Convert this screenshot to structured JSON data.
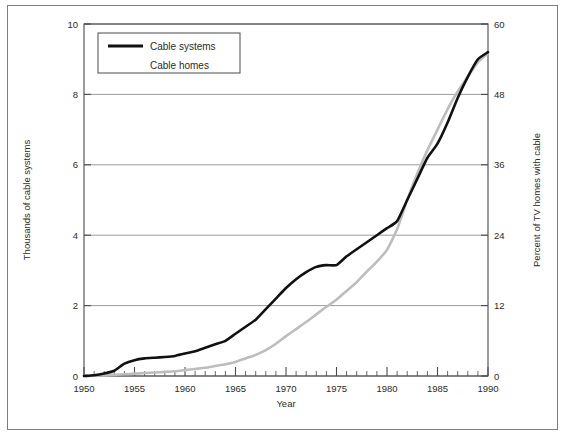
{
  "chart_data": {
    "type": "line",
    "title": "",
    "xlabel": "Year",
    "ylabel": "Thousands of cable systems",
    "ylabel_right": "Percent of TV homes with cable",
    "xlim": [
      1950,
      1990
    ],
    "ylim": [
      0,
      10
    ],
    "ylim_right": [
      0,
      60
    ],
    "grid": true,
    "grid_axis": "y",
    "legend_position": "top-left-inside",
    "x_ticks_major": [
      1950,
      1955,
      1960,
      1965,
      1970,
      1975,
      1980,
      1985,
      1990
    ],
    "x_tick_labels": [
      "1950",
      "1955",
      "1960",
      "1965",
      "1970",
      "1975",
      "1980",
      "1985",
      "1990"
    ],
    "x_minor_tick_interval": 1,
    "y_ticks_left": [
      0,
      2,
      4,
      6,
      8,
      10
    ],
    "y_tick_labels_left": [
      "0",
      "2",
      "4",
      "6",
      "8",
      "10"
    ],
    "y_ticks_right": [
      0,
      12,
      24,
      36,
      48,
      60
    ],
    "y_tick_labels_right": [
      "0",
      "12",
      "24",
      "36",
      "48",
      "60"
    ],
    "series": [
      {
        "name": "Cable systems",
        "axis": "left",
        "color": "#111111",
        "line_width": 2.6,
        "units": "thousands of cable systems",
        "x": [
          1950,
          1951,
          1952,
          1953,
          1954,
          1955,
          1956,
          1957,
          1958,
          1959,
          1960,
          1961,
          1962,
          1963,
          1964,
          1965,
          1966,
          1967,
          1968,
          1969,
          1970,
          1971,
          1972,
          1973,
          1974,
          1975,
          1976,
          1977,
          1978,
          1979,
          1980,
          1981,
          1982,
          1983,
          1984,
          1985,
          1986,
          1987,
          1988,
          1989,
          1990
        ],
        "values": [
          0.0,
          0.02,
          0.07,
          0.15,
          0.35,
          0.45,
          0.5,
          0.52,
          0.54,
          0.57,
          0.64,
          0.7,
          0.8,
          0.9,
          1.0,
          1.2,
          1.4,
          1.6,
          1.9,
          2.2,
          2.5,
          2.75,
          2.95,
          3.1,
          3.15,
          3.15,
          3.4,
          3.6,
          3.8,
          4.0,
          4.2,
          4.4,
          5.0,
          5.6,
          6.2,
          6.6,
          7.2,
          7.9,
          8.5,
          9.0,
          9.2
        ]
      },
      {
        "name": "Cable homes",
        "axis": "right",
        "color": "#bdbdbd",
        "line_width": 2.6,
        "units": "percent of TV homes with cable",
        "x": [
          1950,
          1951,
          1952,
          1953,
          1954,
          1955,
          1956,
          1957,
          1958,
          1959,
          1960,
          1961,
          1962,
          1963,
          1964,
          1965,
          1966,
          1967,
          1968,
          1969,
          1970,
          1971,
          1972,
          1973,
          1974,
          1975,
          1976,
          1977,
          1978,
          1979,
          1980,
          1981,
          1982,
          1983,
          1984,
          1985,
          1986,
          1987,
          1988,
          1989,
          1990
        ],
        "values": [
          0.0,
          0.05,
          0.1,
          0.2,
          0.3,
          0.4,
          0.5,
          0.6,
          0.7,
          0.8,
          1.0,
          1.2,
          1.4,
          1.7,
          2.0,
          2.4,
          3.0,
          3.6,
          4.4,
          5.5,
          6.8,
          8.0,
          9.2,
          10.5,
          11.8,
          13.0,
          14.5,
          16.0,
          17.8,
          19.5,
          21.5,
          25.0,
          30.0,
          34.5,
          38.5,
          42.0,
          45.5,
          48.5,
          51.0,
          53.5,
          55.0
        ]
      }
    ]
  },
  "legend": {
    "entries": [
      {
        "label": "Cable systems",
        "color": "#111111",
        "has_swatch": true
      },
      {
        "label": "Cable homes",
        "color": "#bdbdbd",
        "has_swatch": false
      }
    ]
  },
  "axes": {
    "x_title": "Year",
    "y_left_title": "Thousands of cable systems",
    "y_right_title": "Percent of TV homes with cable"
  },
  "colors": {
    "cable_systems": "#111111",
    "cable_homes": "#bdbdbd",
    "grid": "#909090",
    "axis": "#4a4a4a",
    "frame": "#7d7d7d",
    "text": "#2b2b2b",
    "background": "#ffffff"
  },
  "layout": {
    "plot_left": 84,
    "plot_right": 488,
    "plot_top": 24,
    "plot_bottom": 376
  }
}
